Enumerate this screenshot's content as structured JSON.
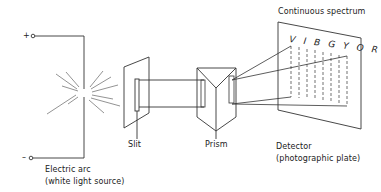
{
  "diagram": {
    "source": {
      "terminal_positive": "+",
      "terminal_negative": "–",
      "label_line1": "Electric arc",
      "label_line2": "(white light source)"
    },
    "slit": {
      "label": "Slit"
    },
    "prism": {
      "label": "Prism"
    },
    "detector": {
      "spectrum_title": "Continuous spectrum",
      "spectrum_colors": "V I B G Y O R",
      "label_line1": "Detector",
      "label_line2": "(photographic plate)"
    },
    "colors": {
      "line": "#333333",
      "background": "#ffffff"
    }
  }
}
